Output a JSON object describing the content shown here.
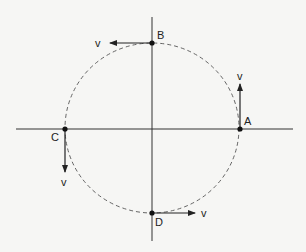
{
  "diagram": {
    "axes": {
      "horizontal": {
        "x1": 16,
        "x2": 293,
        "y": 129
      },
      "vertical": {
        "x": 152,
        "y1": 17,
        "y2": 241
      }
    },
    "circle": {
      "cx": 152,
      "cy": 128,
      "rx": 87,
      "ry": 85,
      "style": "dashed"
    },
    "points": [
      {
        "id": "A",
        "label": "A",
        "x": 240,
        "y": 129,
        "lx": 244,
        "ly": 125,
        "vector": {
          "label": "v",
          "x2": 240,
          "y2": 84,
          "vx": 237,
          "vy": 80
        }
      },
      {
        "id": "B",
        "label": "B",
        "x": 152,
        "y": 43,
        "lx": 157,
        "ly": 39,
        "vector": {
          "label": "v",
          "x2": 110,
          "y2": 43,
          "vx": 95,
          "vy": 47
        }
      },
      {
        "id": "C",
        "label": "C",
        "x": 65,
        "y": 129,
        "lx": 51,
        "ly": 141,
        "vector": {
          "label": "v",
          "x2": 65,
          "y2": 172,
          "vx": 61,
          "vy": 186
        }
      },
      {
        "id": "D",
        "label": "D",
        "x": 152,
        "y": 213,
        "lx": 155,
        "ly": 226,
        "vector": {
          "label": "v",
          "x2": 195,
          "y2": 213,
          "vx": 201,
          "vy": 217
        }
      }
    ],
    "colors": {
      "line": "#333333",
      "dashed": "#555555",
      "background": "#f6f6f4"
    }
  }
}
